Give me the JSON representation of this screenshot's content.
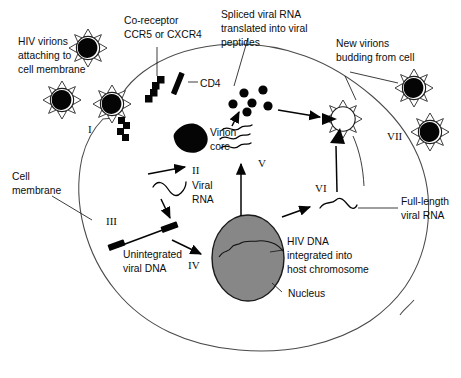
{
  "figure": {
    "type": "biological-process-diagram"
  },
  "labels": {
    "hiv_virions": "HIV virions\nattaching to\ncell membrane",
    "hiv_virions_l1": "HIV virions",
    "hiv_virions_l2": "attaching to",
    "hiv_virions_l3": "cell membrane",
    "coreceptor_l1": "Co-receptor",
    "coreceptor_l2": "CCR5 or CXCR4",
    "cd4": "CD4",
    "spliced_l1": "Spliced viral RNA",
    "spliced_l2": "translated into viral",
    "spliced_l3": "peptides",
    "new_virions_l1": "New virions",
    "new_virions_l2": "budding from cell",
    "virion_core_l1": "Virion",
    "virion_core_l2": "core",
    "viral_rna_l1": "Viral",
    "viral_rna_l2": "RNA",
    "cell_membrane_l1": "Cell",
    "cell_membrane_l2": "membrane",
    "unintegrated_l1": "Unintegrated",
    "unintegrated_l2": "viral DNA",
    "hiv_dna_l1": "HIV DNA",
    "hiv_dna_l2": "integrated into",
    "hiv_dna_l3": "host chromosome",
    "nucleus": "Nucleus",
    "full_length_l1": "Full-length",
    "full_length_l2": "viral RNA"
  },
  "steps": {
    "i": "I",
    "ii": "II",
    "iii": "III",
    "iv": "IV",
    "v": "V",
    "vi": "VI",
    "vii": "VII"
  },
  "colors": {
    "background": "#ffffff",
    "membrane_stroke": "#4a4a4a",
    "nucleus_fill": "#878787",
    "nucleus_stroke": "#1a1a1a",
    "ink": "#050505",
    "text": "#0d0d0d"
  },
  "counts": {
    "free_virions_left": 2,
    "attaching_virions": 1,
    "budding_virions_right": 2,
    "viral_peptide_dots": 6,
    "spliced_rna_strands": 3
  }
}
